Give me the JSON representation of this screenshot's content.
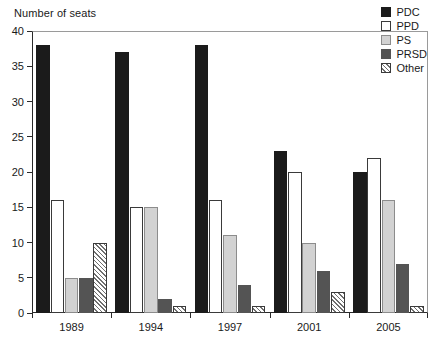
{
  "chart_data": {
    "type": "bar",
    "title": "",
    "ylabel": "Number of seats",
    "xlabel": "",
    "categories": [
      "1989",
      "1994",
      "1997",
      "2001",
      "2005"
    ],
    "series": [
      {
        "name": "PDC",
        "color": "#1b1b1b",
        "fill": "solid-black",
        "values": [
          38,
          37,
          38,
          23,
          20
        ]
      },
      {
        "name": "PPD",
        "color": "#ffffff",
        "fill": "white-outline",
        "values": [
          16,
          15,
          16,
          20,
          22
        ]
      },
      {
        "name": "PS",
        "color": "#d2d2d2",
        "fill": "light-gray",
        "values": [
          5,
          15,
          11,
          10,
          16
        ]
      },
      {
        "name": "PRSD",
        "color": "#545454",
        "fill": "dark-gray",
        "values": [
          5,
          2,
          4,
          6,
          7
        ]
      },
      {
        "name": "Other",
        "color": "#ffffff",
        "fill": "diagonal-hatch",
        "values": [
          10,
          1,
          1,
          3,
          1
        ]
      }
    ],
    "ylim": [
      0,
      40
    ],
    "yticks": [
      0,
      5,
      10,
      15,
      20,
      25,
      30,
      35,
      40
    ],
    "ytick_labels": [
      "0",
      "5",
      "10",
      "15",
      "20",
      "25",
      "30",
      "35",
      "40"
    ],
    "grid": false,
    "legend_position": "top-right",
    "legend_entries": [
      "PDC",
      "PPD",
      "PS",
      "PRSD",
      "Other"
    ]
  }
}
